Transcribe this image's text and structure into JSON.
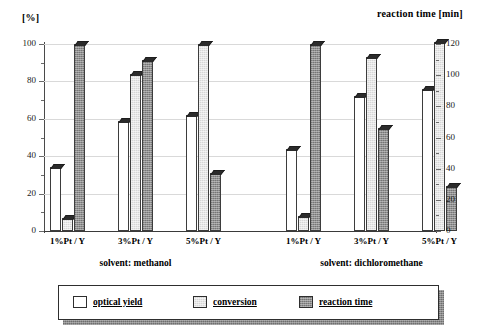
{
  "chart_data": {
    "type": "bar",
    "title": "",
    "subtitle": "",
    "ylabel": "[%]",
    "ylabel_right": "reaction time [min]",
    "xlabel": "",
    "ylim": [
      0,
      100
    ],
    "ylim_right": [
      0,
      120
    ],
    "yticks": [
      "0",
      "20",
      "40",
      "60",
      "80",
      "100"
    ],
    "yticks_right": [
      "0",
      "20",
      "40",
      "60",
      "80",
      "100",
      "120"
    ],
    "grid": true,
    "legend_position": "bottom",
    "categories": [
      "1%Pt / Y",
      "3%Pt / Y",
      "5%Pt / Y",
      "1%Pt / Y",
      "3%Pt / Y",
      "5%Pt / Y"
    ],
    "groups": [
      {
        "label": "solvent: methanol"
      },
      {
        "label": "solvent: dichloromethane"
      }
    ],
    "series": [
      {
        "name": "optical yield",
        "color": "#ffffff",
        "unit": "%",
        "axis": "left",
        "values": [
          34,
          59,
          62,
          44,
          72,
          76
        ]
      },
      {
        "name": "conversion",
        "color": "#d6d6d6",
        "unit": "%",
        "axis": "left",
        "values": [
          7,
          84,
          100,
          8,
          93,
          101
        ]
      },
      {
        "name": "reaction time",
        "color": "#8f8f8f",
        "unit": "min",
        "axis": "right",
        "values": [
          120,
          110,
          37,
          120,
          66,
          29
        ]
      }
    ]
  },
  "legend": {
    "items": [
      {
        "label": "optical yield"
      },
      {
        "label": "conversion"
      },
      {
        "label": "reaction time"
      }
    ]
  }
}
